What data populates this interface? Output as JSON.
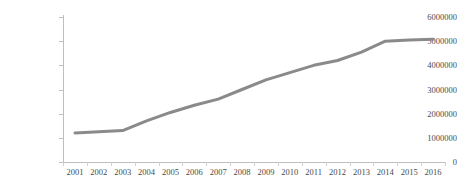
{
  "chart_data": {
    "type": "line",
    "title": "",
    "subtitle": "",
    "xlabel": "",
    "ylabel": "",
    "categories": [
      "2001",
      "2002",
      "2003",
      "2004",
      "2005",
      "2006",
      "2007",
      "2008",
      "2009",
      "2010",
      "2011",
      "2012",
      "2013",
      "2014",
      "2015",
      "2016"
    ],
    "values": [
      1200000,
      1250000,
      1300000,
      1700000,
      2050000,
      2350000,
      2600000,
      3000000,
      3400000,
      3700000,
      4000000,
      4200000,
      4550000,
      5000000,
      5050000,
      5080000
    ],
    "series": [
      {
        "name": "",
        "values": [
          1200000,
          1250000,
          1300000,
          1700000,
          2050000,
          2350000,
          2600000,
          3000000,
          3400000,
          3700000,
          4000000,
          4200000,
          4550000,
          5000000,
          5050000,
          5080000
        ],
        "color": "#8a8a8a"
      }
    ],
    "ylim": [
      0,
      6000000
    ],
    "yticks": [
      0,
      1000000,
      2000000,
      3000000,
      4000000,
      5000000,
      6000000
    ],
    "ytick_labels": [
      "0",
      "1000000",
      "2000000",
      "3000000",
      "4000000",
      "5000000",
      "6000000"
    ],
    "grid": false,
    "legend": false,
    "legend_position": "none",
    "markers": false,
    "line_width": 3,
    "colors": {
      "line": "#8a8a8a",
      "axis": "#bfbfbf",
      "tick_label": "#4a4a4a",
      "background": "#ffffff"
    }
  }
}
